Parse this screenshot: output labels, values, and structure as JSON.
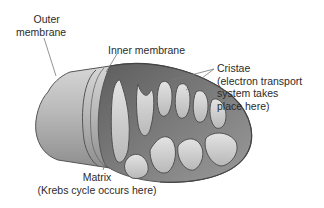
{
  "diagram": {
    "labels": {
      "outer_membrane": [
        "Outer",
        "membrane"
      ],
      "inner_membrane": "Inner membrane",
      "cristae": [
        "Cristae",
        "(electron transport",
        "system takes",
        "place here)"
      ],
      "matrix": [
        "Matrix",
        "(Krebs cycle occurs here)"
      ]
    },
    "colors": {
      "outer_shell": "#c8c8c8",
      "shell_dark": "#8f8f8f",
      "inner_dark": "#6e6e6e",
      "cristae_fill": "#d9d9d9",
      "outline": "#555555",
      "leader_line": "#777777"
    }
  }
}
